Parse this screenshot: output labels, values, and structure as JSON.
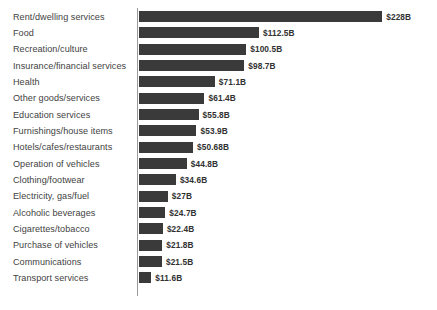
{
  "chart_data": {
    "type": "bar",
    "orientation": "horizontal",
    "title": "",
    "subtitle": "",
    "xlabel": "",
    "ylabel": "",
    "grid": false,
    "legend": false,
    "legend_position": "none",
    "axis_line": true,
    "bar_color": "#3a3a3a",
    "background_color": "#ffffff",
    "value_prefix": "$",
    "value_suffix": "B",
    "xlim": [
      0,
      228
    ],
    "categories": [
      "Rent/dwelling services",
      "Food",
      "Recreation/culture",
      "Insurance/financial services",
      "Health",
      "Other goods/services",
      "Education services",
      "Furnishings/house items",
      "Hotels/cafes/restaurants",
      "Operation of vehicles",
      "Clothing/footwear",
      "Electricity, gas/fuel",
      "Alcoholic beverages",
      "Cigarettes/tobacco",
      "Purchase of vehicles",
      "Communications",
      "Transport services"
    ],
    "values": [
      228,
      112.5,
      100.5,
      98.7,
      71.1,
      61.4,
      55.8,
      53.9,
      50.68,
      44.8,
      34.6,
      27,
      24.7,
      22.4,
      21.8,
      21.5,
      11.6
    ],
    "value_labels": [
      "$228B",
      "$112.5B",
      "$100.5B",
      "$98.7B",
      "$71.1B",
      "$61.4B",
      "$55.8B",
      "$53.9B",
      "$50.68B",
      "$44.8B",
      "$34.6B",
      "$27B",
      "$24.7B",
      "$22.4B",
      "$21.8B",
      "$21.5B",
      "$11.6B"
    ]
  },
  "layout": {
    "bar_origin_x": 139,
    "px_per_unit": 1.0667,
    "first_row_top": 8.5,
    "row_pitch": 16.35,
    "bar_height": 11,
    "value_gap": 4
  }
}
